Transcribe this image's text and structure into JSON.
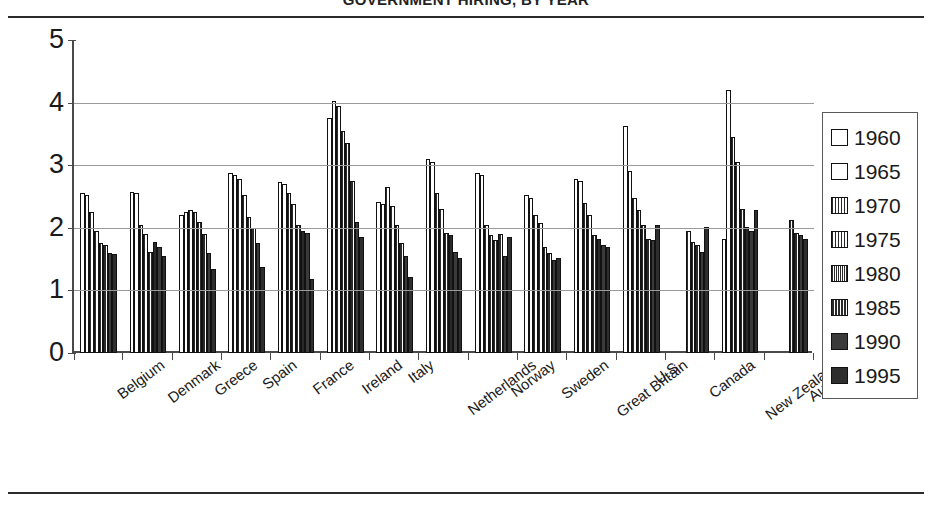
{
  "title": "GOVERNMENT HIRING, BY YEAR",
  "legend": {
    "position": "right",
    "items": [
      {
        "label": "1960",
        "pattern": "p0"
      },
      {
        "label": "1965",
        "pattern": "p1"
      },
      {
        "label": "1970",
        "pattern": "p2"
      },
      {
        "label": "1975",
        "pattern": "p3"
      },
      {
        "label": "1980",
        "pattern": "p4"
      },
      {
        "label": "1985",
        "pattern": "p5"
      },
      {
        "label": "1990",
        "pattern": "p6"
      },
      {
        "label": "1995",
        "pattern": "p7"
      }
    ]
  },
  "yaxis": {
    "ticks": [
      "0",
      "1",
      "2",
      "3",
      "4",
      "5"
    ],
    "min": 0,
    "max": 5
  },
  "chart_data": {
    "type": "bar",
    "title": "GOVERNMENT HIRING, BY YEAR",
    "xlabel": "",
    "ylabel": "",
    "ylim": [
      0,
      5
    ],
    "grid": true,
    "legend_position": "right",
    "categories": [
      "Belgium",
      "Denmark",
      "Greece",
      "Spain",
      "France",
      "Ireland",
      "Italy",
      "Netherlands",
      "Norway",
      "Sweden",
      "Great Britain",
      "U.S.",
      "Canada",
      "New Zealand",
      "Australia"
    ],
    "series": [
      {
        "name": "1960",
        "values": [
          2.55,
          2.58,
          2.2,
          2.87,
          2.73,
          3.75,
          2.42,
          3.1,
          2.87,
          2.52,
          2.78,
          3.62,
          null,
          1.82,
          null
        ]
      },
      {
        "name": "1965",
        "values": [
          2.52,
          2.55,
          2.25,
          2.85,
          2.7,
          4.02,
          2.38,
          3.05,
          2.85,
          2.48,
          2.75,
          2.9,
          null,
          4.2,
          null
        ]
      },
      {
        "name": "1970",
        "values": [
          2.25,
          2.05,
          2.28,
          2.78,
          2.55,
          3.95,
          2.65,
          2.55,
          2.05,
          2.2,
          2.4,
          2.48,
          null,
          3.45,
          null
        ]
      },
      {
        "name": "1975",
        "values": [
          1.95,
          1.9,
          2.25,
          2.52,
          2.38,
          3.55,
          2.35,
          2.3,
          1.88,
          2.08,
          2.2,
          2.28,
          1.95,
          3.05,
          null
        ]
      },
      {
        "name": "1980",
        "values": [
          1.75,
          1.62,
          2.1,
          2.18,
          2.05,
          3.35,
          2.05,
          1.92,
          1.8,
          1.7,
          1.88,
          2.05,
          1.78,
          2.3,
          2.12
        ]
      },
      {
        "name": "1985",
        "values": [
          1.72,
          1.78,
          1.9,
          2.0,
          1.95,
          2.75,
          1.75,
          1.88,
          1.9,
          1.6,
          1.82,
          1.82,
          1.72,
          2.02,
          1.92
        ]
      },
      {
        "name": "1990",
        "values": [
          1.6,
          1.7,
          1.6,
          1.75,
          1.92,
          2.1,
          1.55,
          1.62,
          1.55,
          1.48,
          1.72,
          1.8,
          1.62,
          1.95,
          1.88
        ]
      },
      {
        "name": "1995",
        "values": [
          1.58,
          1.55,
          1.35,
          1.38,
          1.18,
          1.85,
          1.22,
          1.52,
          1.85,
          1.52,
          1.7,
          2.05,
          2.02,
          2.28,
          1.82
        ]
      }
    ]
  }
}
